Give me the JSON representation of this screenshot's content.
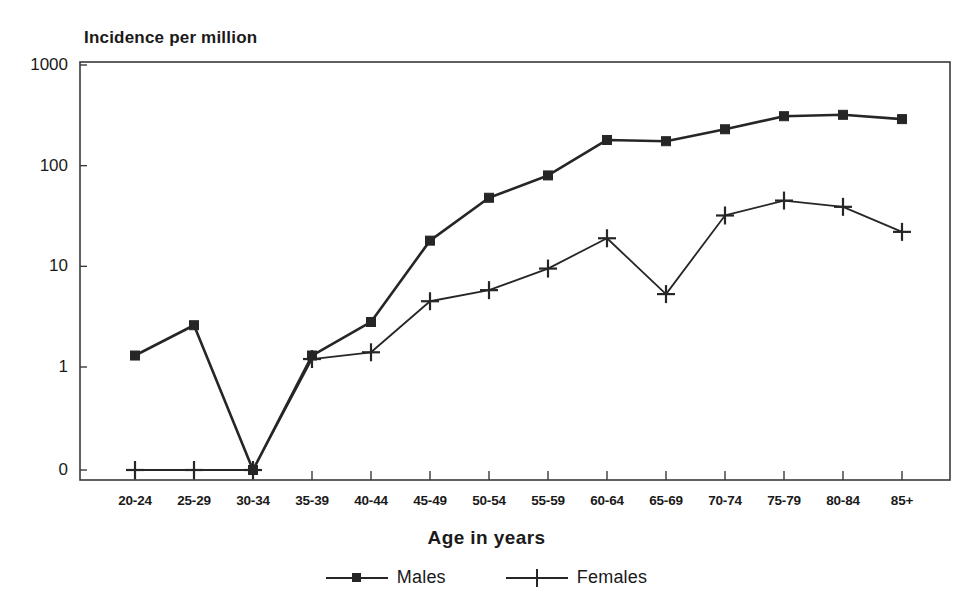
{
  "chart_data": {
    "type": "line",
    "title": "Incidence per million",
    "xlabel": "Age in years",
    "ylabel": "Incidence per million",
    "categories": [
      "20-24",
      "25-29",
      "30-34",
      "35-39",
      "40-44",
      "45-49",
      "50-54",
      "55-59",
      "60-64",
      "65-69",
      "70-74",
      "75-79",
      "80-84",
      "85+"
    ],
    "yticks": [
      "0",
      "1",
      "10",
      "100",
      "1000"
    ],
    "ytick_values": [
      0,
      1,
      10,
      100,
      1000
    ],
    "yscale": "log-with-zero-baseline",
    "ylim": [
      0,
      1000
    ],
    "grid": false,
    "legend_position": "bottom",
    "series": [
      {
        "name": "Males",
        "marker": "square",
        "color": "#262626",
        "values": [
          1.3,
          2.6,
          0,
          1.3,
          2.8,
          18,
          48,
          80,
          180,
          175,
          230,
          310,
          320,
          290
        ]
      },
      {
        "name": "Females",
        "marker": "plus",
        "color": "#262626",
        "values": [
          0,
          0,
          0,
          1.2,
          1.4,
          4.5,
          5.8,
          9.5,
          19,
          5.3,
          32,
          45,
          39,
          22
        ]
      }
    ]
  },
  "legend": {
    "entries": [
      {
        "label": "Males"
      },
      {
        "label": "Females"
      }
    ]
  }
}
